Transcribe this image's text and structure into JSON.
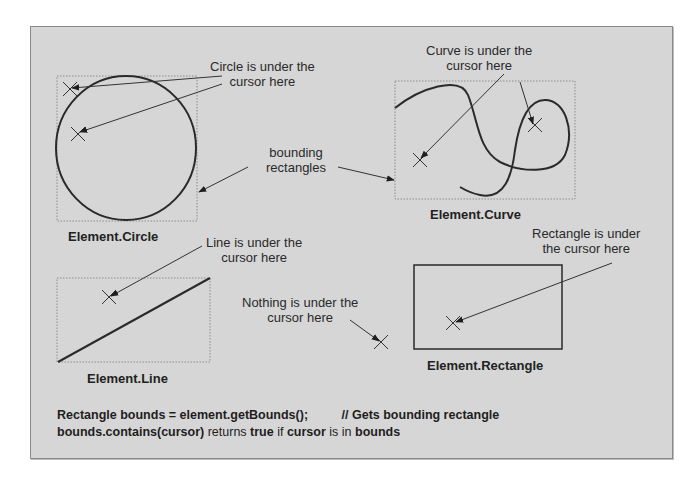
{
  "labels": {
    "circle_note": [
      "Circle is under the",
      "cursor here"
    ],
    "curve_note": [
      "Curve is under the",
      "cursor here"
    ],
    "bounding_note": [
      "bounding",
      "rectangles"
    ],
    "line_note": [
      "Line is under the",
      "cursor here"
    ],
    "nothing_note": [
      "Nothing is under the",
      "cursor here"
    ],
    "rect_note": [
      "Rectangle is under",
      "the cursor here"
    ]
  },
  "captions": {
    "circle": "Element.Circle",
    "curve": "Element.Curve",
    "line": "Element.Line",
    "rectangle": "Element.Rectangle"
  },
  "code": {
    "line1_code": "Rectangle bounds = element.getBounds();",
    "line1_comment": "// Gets bounding rectangle",
    "line2": [
      {
        "text": "bounds.contains(cursor)",
        "bold": true
      },
      {
        "text": " returns ",
        "bold": false
      },
      {
        "text": "true",
        "bold": true
      },
      {
        "text": " if ",
        "bold": false
      },
      {
        "text": "cursor",
        "bold": true
      },
      {
        "text": " is in ",
        "bold": false
      },
      {
        "text": "bounds",
        "bold": true
      }
    ]
  },
  "colors": {
    "background": "#d6d6d6",
    "stroke": "#2a2a2a",
    "bounds": "#8c8c8c"
  }
}
